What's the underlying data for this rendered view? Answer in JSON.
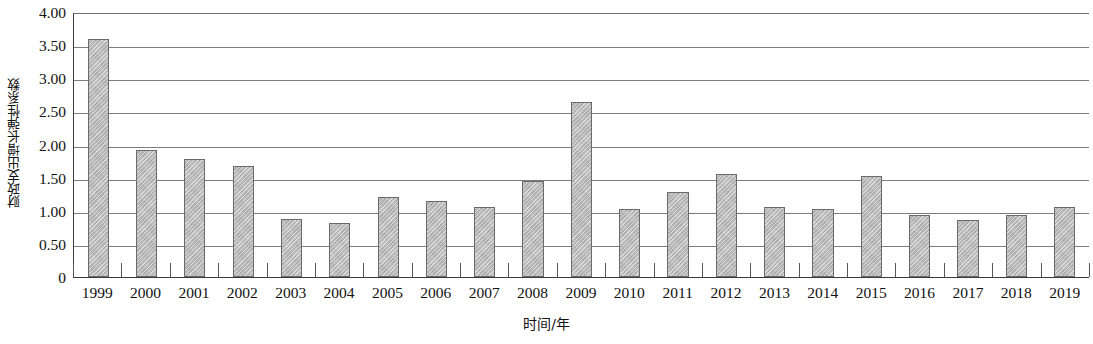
{
  "chart_data": {
    "type": "bar",
    "title": "",
    "xlabel": "时间/年",
    "ylabel": "财政支出增长弹性系数",
    "categories": [
      "1999",
      "2000",
      "2001",
      "2002",
      "2003",
      "2004",
      "2005",
      "2006",
      "2007",
      "2008",
      "2009",
      "2010",
      "2011",
      "2012",
      "2013",
      "2014",
      "2015",
      "2016",
      "2017",
      "2018",
      "2019"
    ],
    "values": [
      3.59,
      1.91,
      1.78,
      1.67,
      0.87,
      0.81,
      1.21,
      1.15,
      1.05,
      1.45,
      2.64,
      1.03,
      1.28,
      1.56,
      1.06,
      1.02,
      1.52,
      0.94,
      0.86,
      0.93,
      1.05
    ],
    "ylim": [
      0,
      4.0
    ],
    "ytick_values": [
      4.0,
      3.5,
      3.0,
      2.5,
      2.0,
      1.5,
      1.0,
      0.5,
      0
    ],
    "ytick_labels": [
      "4.00",
      "3.50",
      "3.00",
      "2.50",
      "2.00",
      "1.50",
      "1.00",
      "0.50",
      "0"
    ],
    "grid": true,
    "legend": false,
    "bar_color": "#b9b9b9",
    "bar_border_color": "#6a6a6a",
    "gridline_color": "#7c7c7c",
    "axis_color": "#3a3a3a"
  }
}
